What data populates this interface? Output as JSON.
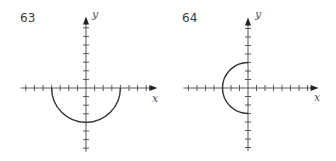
{
  "figures": [
    {
      "number": "63",
      "x_label": "x",
      "y_label": "y",
      "origin_px": [
        86,
        88
      ],
      "unit_px": 8.6,
      "x_ticks": {
        "min": -7,
        "max": 7
      },
      "y_ticks": {
        "min": -7,
        "max": 7
      },
      "curve": {
        "type": "semicircle",
        "center": [
          0,
          0
        ],
        "radius": 4,
        "half": "lower",
        "color": "#333333"
      }
    },
    {
      "number": "64",
      "x_label": "x",
      "y_label": "y",
      "origin_px": [
        80,
        88
      ],
      "unit_px": 8.5,
      "x_ticks": {
        "min": -7,
        "max": 7
      },
      "y_ticks": {
        "min": -7,
        "max": 7
      },
      "curve": {
        "type": "semicircle",
        "center": [
          0,
          0
        ],
        "radius": 3,
        "half": "left",
        "color": "#333333"
      }
    }
  ],
  "colors": {
    "axis": "#555555",
    "curve": "#333333",
    "background": "#ffffff"
  },
  "chart_data": [
    {
      "type": "line",
      "title": "63",
      "xlabel": "x",
      "ylabel": "y",
      "xlim": [
        -8,
        8
      ],
      "ylim": [
        -8,
        8
      ],
      "grid": false,
      "description": "Lower semicircle of radius 4 centered at origin: y = -sqrt(16 - x^2)",
      "x": [
        -4,
        -3,
        -2,
        -1,
        0,
        1,
        2,
        3,
        4
      ],
      "series": [
        {
          "name": "curve",
          "values": [
            0,
            -2.65,
            -3.46,
            -3.87,
            -4,
            -3.87,
            -3.46,
            -2.65,
            0
          ]
        }
      ]
    },
    {
      "type": "line",
      "title": "64",
      "xlabel": "x",
      "ylabel": "y",
      "xlim": [
        -8,
        8
      ],
      "ylim": [
        -8,
        8
      ],
      "grid": false,
      "description": "Left semicircle of radius 3 centered at origin: x = -sqrt(9 - y^2)",
      "y": [
        -3,
        -2,
        -1,
        0,
        1,
        2,
        3
      ],
      "series": [
        {
          "name": "curve",
          "values": [
            0,
            -2.24,
            -2.83,
            -3,
            -2.83,
            -2.24,
            0
          ]
        }
      ]
    }
  ]
}
